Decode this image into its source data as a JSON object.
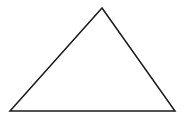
{
  "diagram": {
    "background": "#ffffff",
    "shapes": [
      {
        "type": "triangle",
        "stroke": "#1a1a1a",
        "stroke_width": 1.5,
        "fill": "none",
        "vertices": [
          [
            102,
            8
          ],
          [
            10,
            111
          ],
          [
            175,
            111
          ]
        ]
      }
    ]
  }
}
